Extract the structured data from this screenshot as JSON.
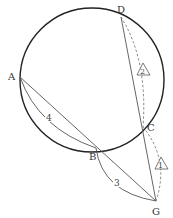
{
  "diagram": {
    "type": "geometry",
    "circle": {
      "cx": 92,
      "cy": 80,
      "r": 72
    },
    "points": {
      "A": {
        "label": "A",
        "x": 20,
        "y": 77
      },
      "B": {
        "label": "B",
        "x": 96,
        "y": 148
      },
      "C": {
        "label": "C",
        "x": 143,
        "y": 127
      },
      "D": {
        "label": "D",
        "x": 121,
        "y": 17
      },
      "G": {
        "label": "G",
        "x": 156,
        "y": 201
      }
    },
    "lines": [
      {
        "from": "A",
        "to": "G",
        "style": "solid"
      },
      {
        "from": "D",
        "to": "G",
        "style": "solid"
      }
    ],
    "arcs": [
      {
        "id": "arc-AB",
        "label": "4",
        "style": "solid"
      },
      {
        "id": "arc-BG",
        "label": "3",
        "style": "solid"
      },
      {
        "id": "arc-DC",
        "label": "2",
        "style": "dashed",
        "marker": "triangle"
      },
      {
        "id": "arc-CG",
        "label": "1",
        "style": "dashed",
        "marker": "triangle"
      }
    ],
    "labels": {
      "arc_AB": "4",
      "arc_BG": "3",
      "arc_DC": "2",
      "arc_CG": "1"
    },
    "colors": {
      "stroke": "#222222",
      "thin": "#555555",
      "dashed": "#777777"
    }
  }
}
